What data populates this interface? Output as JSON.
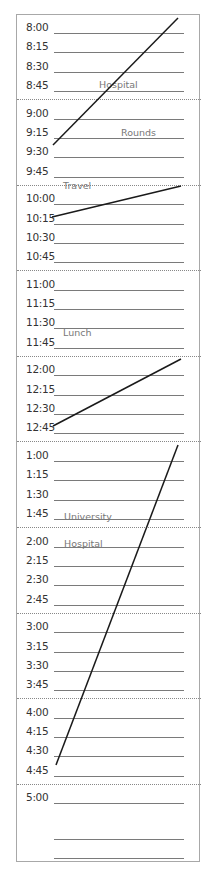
{
  "schedule": {
    "hours": [
      {
        "slots": [
          "8:00",
          "8:15",
          "8:30",
          "8:45"
        ]
      },
      {
        "slots": [
          "9:00",
          "9:15",
          "9:30",
          "9:45"
        ]
      },
      {
        "slots": [
          "10:00",
          "10:15",
          "10:30",
          "10:45"
        ]
      },
      {
        "slots": [
          "11:00",
          "11:15",
          "11:30",
          "11:45"
        ]
      },
      {
        "slots": [
          "12:00",
          "12:15",
          "12:30",
          "12:45"
        ]
      },
      {
        "slots": [
          "1:00",
          "1:15",
          "1:30",
          "1:45"
        ]
      },
      {
        "slots": [
          "2:00",
          "2:15",
          "2:30",
          "2:45"
        ]
      },
      {
        "slots": [
          "3:00",
          "3:15",
          "3:30",
          "3:45"
        ]
      },
      {
        "slots": [
          "4:00",
          "4:15",
          "4:30",
          "4:45"
        ]
      },
      {
        "slots": [
          "5:00",
          "",
          ""
        ]
      }
    ],
    "notes": [
      {
        "text": "Hospital",
        "slot": "8:45"
      },
      {
        "text": "Rounds",
        "slot": "9:15"
      },
      {
        "text": "Travel",
        "slot": "10:00"
      },
      {
        "text": "Lunch",
        "slot": "12:15"
      },
      {
        "text": "University",
        "slot": "1:45"
      },
      {
        "text": "Hospital",
        "slot": "2:00"
      }
    ]
  }
}
